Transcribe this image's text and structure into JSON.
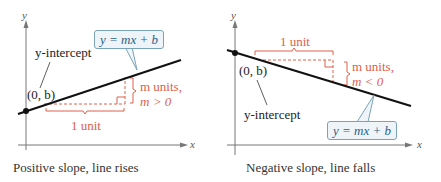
{
  "colors": {
    "line": "#111111",
    "axis": "#777777",
    "annotation_red": "#e0604a",
    "equation_text": "#2e5f86",
    "equation_box_border": "#7aa3b8",
    "equation_box_fill": "#eef4f8"
  },
  "left": {
    "y_axis_label": "y",
    "x_axis_label": "x",
    "intercept_label": "y-intercept",
    "point_label": "(0, b)",
    "equation": "y = mx + b",
    "rise_label_line1": "m units,",
    "rise_label_line2": "m > 0",
    "run_label": "1 unit",
    "caption": "Positive slope, line rises"
  },
  "right": {
    "y_axis_label": "y",
    "x_axis_label": "x",
    "intercept_label": "y-intercept",
    "point_label": "(0, b)",
    "equation": "y = mx + b",
    "rise_label_line1": "m units,",
    "rise_label_line2": "m < 0",
    "run_label": "1 unit",
    "caption": "Negative slope, line falls"
  }
}
